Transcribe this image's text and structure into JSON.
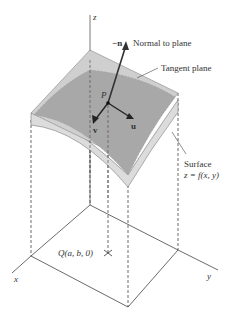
{
  "diagram": {
    "type": "3d-surface-tangent-plane",
    "axes": {
      "x_label": "x",
      "y_label": "y",
      "z_label": "z"
    },
    "labels": {
      "neg_n": "−n",
      "normal": "Normal to plane",
      "tangent_plane": "Tangent plane",
      "point_p": "P",
      "vector_u": "u",
      "vector_v": "v",
      "surface_line1": "Surface",
      "surface_line2": "z = f(x, y)",
      "point_q": "Q(a, b, 0)"
    },
    "colors": {
      "tangent_plane": "#c8c8c8",
      "surface": "#a9a9a9",
      "surface_underside": "#d9d9d9",
      "lines": "#333333"
    }
  }
}
